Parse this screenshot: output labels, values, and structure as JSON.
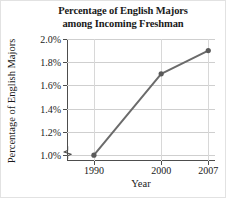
{
  "chart_data": {
    "type": "line",
    "title": "Percentage of English Majors among Incoming Freshman",
    "title_lines": [
      "Percentage of English Majors",
      "among Incoming Freshman"
    ],
    "xlabel": "Year",
    "ylabel": "Percentage of English Majors",
    "x": [
      1990,
      2000,
      2007
    ],
    "categories": [
      "1990",
      "2000",
      "2007"
    ],
    "values": [
      1.0,
      1.7,
      1.9
    ],
    "series": [
      {
        "name": "Percentage of English Majors",
        "values": [
          1.0,
          1.7,
          1.9
        ]
      }
    ],
    "xtick_labels": [
      "1990",
      "2000",
      "2007"
    ],
    "ytick_labels": [
      "1.0%",
      "1.2%",
      "1.4%",
      "1.6%",
      "1.8%",
      "2.0%"
    ],
    "ytick_values": [
      1.0,
      1.2,
      1.4,
      1.6,
      1.8,
      2.0
    ],
    "ylim": [
      0.95,
      2.0
    ],
    "xlim": [
      1986,
      2008
    ],
    "grid": true,
    "grid_axis": "both",
    "legend": false,
    "axis_break_y": true,
    "marker": "circle",
    "line_color": "#6b6b6b",
    "marker_color": "#5a5a5a",
    "grid_color": "#cfcfcf",
    "axis_color": "#4d4d4d",
    "text_color": "#1a1a1a",
    "background": "#ffffff"
  }
}
